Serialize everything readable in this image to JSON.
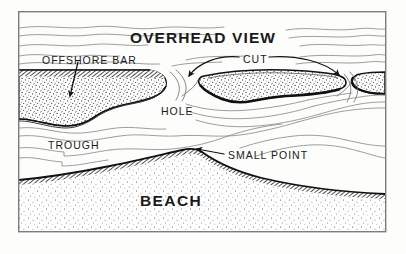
{
  "figure": {
    "kind": "hand-drawn coastal overhead-view diagram",
    "title": "OVERHEAD VIEW",
    "background_color": "#fdfdfc",
    "ink_color": "#1a1a1a",
    "water_line_color": "#8d8d8d",
    "frame": {
      "name": "diagram-frame",
      "x": 18,
      "y": 11,
      "width": 368,
      "height": 221,
      "stroke_color": "#7c7c7c",
      "stroke_width": 1.4
    },
    "labels": [
      {
        "id": "title",
        "text": "OVERHEAD VIEW",
        "x": 130,
        "y": 30,
        "style": "title"
      },
      {
        "id": "offshore_bar",
        "text": "OFFSHORE BAR",
        "x": 42,
        "y": 55,
        "style": "plain"
      },
      {
        "id": "cut",
        "text": "CUT",
        "x": 243,
        "y": 54,
        "style": "plain"
      },
      {
        "id": "hole",
        "text": "HOLE",
        "x": 161,
        "y": 106,
        "style": "plain"
      },
      {
        "id": "trough",
        "text": "TROUGH",
        "x": 48,
        "y": 140,
        "style": "plain"
      },
      {
        "id": "small_point",
        "text": "SMALL POINT",
        "x": 228,
        "y": 150,
        "style": "plain"
      },
      {
        "id": "beach",
        "text": "BEACH",
        "x": 140,
        "y": 193,
        "style": "beach"
      }
    ],
    "features": {
      "offshore_bar_left": "stippled sand bar entering from the left edge, dark hatched top margin, tapering to a point at right",
      "offshore_bar_center": "elongated stippled island with heavy dark outline, thickest along the lower edge",
      "offshore_bar_right": "stippled sand bar fragment entering from the right edge with a rounded left tip",
      "cut_left": "narrow water channel between the left bar and the center bar",
      "cut_right": "narrow water channel between the center bar and the right bar",
      "hole": "deep water pocket shoreward of the cuts, shown by tightly nested contour lines",
      "trough": "open water band running between the bars and the beach",
      "beach": "stippled sand along the bottom with a dark shoreline edge",
      "small_point": "apex bulge in the shoreline near the middle of the beach"
    },
    "arrows": [
      {
        "id": "arrow-offshore-bar",
        "from": [
          78,
          62
        ],
        "to": [
          70,
          96
        ],
        "type": "straight"
      },
      {
        "id": "arrow-cut-left",
        "from": [
          238,
          57
        ],
        "to": [
          188,
          78
        ],
        "type": "curved"
      },
      {
        "id": "arrow-cut-right",
        "from": [
          268,
          57
        ],
        "to": [
          340,
          77
        ],
        "type": "curved"
      },
      {
        "id": "arrow-small-point",
        "from": [
          222,
          155
        ],
        "to": [
          196,
          150
        ],
        "type": "straight"
      }
    ]
  }
}
